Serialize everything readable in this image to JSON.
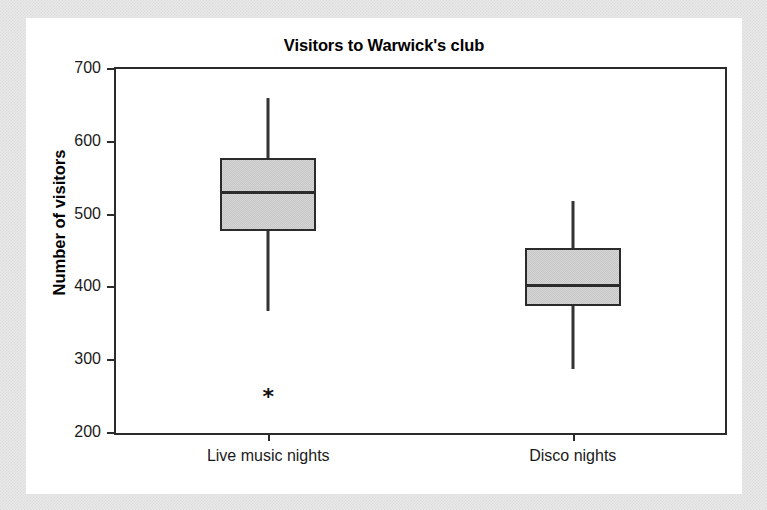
{
  "chart_data": {
    "type": "box",
    "title": "Visitors to Warwick's club",
    "xlabel": "",
    "ylabel": "Number of visitors",
    "ylim": [
      200,
      700
    ],
    "ytick_labels": [
      "700",
      "600",
      "500",
      "400",
      "300",
      "200"
    ],
    "yticks": [
      700,
      600,
      500,
      400,
      300,
      200
    ],
    "grid": false,
    "legend": false,
    "categories": [
      "Live music nights",
      "Disco nights"
    ],
    "boxes": [
      {
        "category": "Live music nights",
        "whisker_low": 368,
        "q1": 478,
        "median": 530,
        "q3": 578,
        "whisker_high": 660,
        "outliers": [
          250
        ]
      },
      {
        "category": "Disco nights",
        "whisker_low": 288,
        "q1": 375,
        "median": 402,
        "q3": 454,
        "whisker_high": 518,
        "outliers": []
      }
    ]
  },
  "colors": {
    "box_fill": "#d6d6d6",
    "box_stroke": "#2b2b2b",
    "axis": "#2b2b2b",
    "text": "#000000",
    "mat": "#e9e9e9",
    "card": "#ffffff"
  },
  "icons": {
    "outlier": "*"
  }
}
